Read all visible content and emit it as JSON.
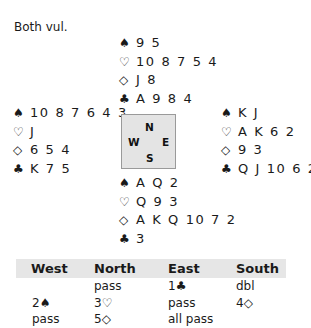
{
  "vulnerability": "Both vul.",
  "compass": {
    "north": "N",
    "west": "W",
    "east": "E",
    "south": "S"
  },
  "suits": {
    "spades": "♠",
    "hearts": "♡",
    "diamonds": "◇",
    "clubs": "♣"
  },
  "hands": {
    "north": {
      "spades": "9 5",
      "hearts": "10 8 7 5 4",
      "diamonds": "J 8",
      "clubs": "A 9 8 4"
    },
    "west": {
      "spades": "10 8 7 6 4 3",
      "hearts": "J",
      "diamonds": "6 5 4",
      "clubs": "K 7 5"
    },
    "east": {
      "spades": "K J",
      "hearts": "A K 6 2",
      "diamonds": "9 3",
      "clubs": "Q J 10 6 2"
    },
    "south": {
      "spades": "A Q 2",
      "hearts": "Q 9 3",
      "diamonds": "A K Q 10 7 2",
      "clubs": "3"
    }
  },
  "bidding": {
    "headers": [
      "West",
      "North",
      "East",
      "South"
    ],
    "rows": [
      [
        "",
        "pass",
        "1♣",
        "dbl"
      ],
      [
        "2♠",
        "3♡",
        "pass",
        "4◇"
      ],
      [
        "pass",
        "5◇",
        "all pass",
        ""
      ]
    ]
  }
}
